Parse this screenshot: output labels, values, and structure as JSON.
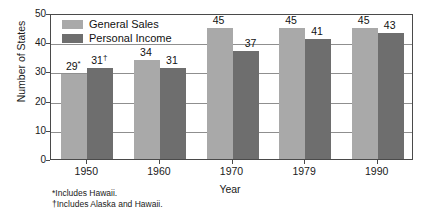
{
  "chart_data": {
    "type": "bar",
    "title": "",
    "xlabel": "Year",
    "ylabel": "Number of States",
    "categories": [
      "1950",
      "1960",
      "1970",
      "1979",
      "1990"
    ],
    "ylim": [
      0,
      50
    ],
    "yticks": [
      "0",
      "10",
      "20",
      "30",
      "40",
      "50"
    ],
    "grid": true,
    "legend_position": "top-left",
    "series": [
      {
        "name": "General Sales",
        "color": "#a9a9a9",
        "values": [
          29,
          34,
          45,
          45,
          45
        ],
        "labels": [
          "29*",
          "34",
          "45",
          "45",
          "45"
        ]
      },
      {
        "name": "Personal Income",
        "color": "#6e6e6e",
        "values": [
          31,
          31,
          37,
          41,
          43
        ],
        "labels": [
          "31†",
          "31",
          "37",
          "41",
          "43"
        ]
      }
    ],
    "annotations": [
      "*Includes Hawaii.",
      "†Includes Alaska and Hawaii."
    ]
  },
  "legend": {
    "items": [
      {
        "label": "General Sales"
      },
      {
        "label": "Personal Income"
      }
    ]
  },
  "footnotes": {
    "line1": "*Includes Hawaii.",
    "line2": "†Includes Alaska and Hawaii."
  }
}
